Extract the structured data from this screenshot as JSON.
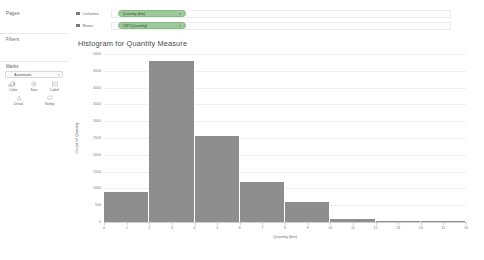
{
  "sidebar": {
    "pages_label": "Pages",
    "filters_label": "Filters",
    "marks_label": "Marks",
    "marks_type": "Automatic",
    "marks_caret": "▾",
    "buttons": [
      {
        "label": "Color",
        "icon": "color-palette-icon"
      },
      {
        "label": "Size",
        "icon": "size-icon"
      },
      {
        "label": "Label",
        "icon": "label-icon"
      },
      {
        "label": "Detail",
        "icon": "detail-icon"
      },
      {
        "label": "Tooltip",
        "icon": "tooltip-icon"
      }
    ]
  },
  "shelves": {
    "columns_label": "Columns",
    "rows_label": "Rows",
    "columns_pill": "Quantity (bin)",
    "rows_pill": "CNT(Quantity)",
    "pill_caret": "▾",
    "pill_color": "#9ec99a"
  },
  "chart_data": {
    "type": "bar",
    "title": "Histogram for Quantity Measure",
    "xlabel": "Quantity (bin)",
    "ylabel": "Count of Quantity",
    "categories": [
      0,
      2,
      4,
      6,
      8,
      10,
      12,
      14
    ],
    "values": [
      900,
      4800,
      2550,
      1200,
      600,
      100,
      40,
      20
    ],
    "bin_width": 2,
    "xticks": [
      0,
      1,
      2,
      3,
      4,
      5,
      6,
      7,
      8,
      9,
      10,
      11,
      12,
      13,
      14,
      15,
      16
    ],
    "yticks": [
      0,
      500,
      1000,
      1500,
      2000,
      2500,
      3000,
      3500,
      4000,
      4500,
      5000
    ],
    "ylim": [
      0,
      5000
    ],
    "xlim": [
      0,
      16
    ],
    "grid": true,
    "legend": false,
    "bar_color": "#8e8e8e"
  }
}
